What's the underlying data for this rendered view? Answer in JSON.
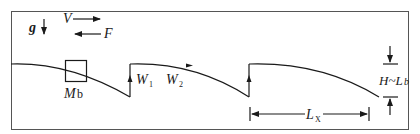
{
  "diagram": {
    "type": "schematic",
    "colors": {
      "line": "#1a1a1a",
      "frame": "#555555",
      "background": "#ffffff"
    },
    "labels": {
      "gravity": "g",
      "velocity": "V",
      "force": "F",
      "mass": "M",
      "mass_sub": "b",
      "w1": "W",
      "w1_sub": "1",
      "w2": "W",
      "w2_sub": "2",
      "height": "H~L",
      "height_sub": "b",
      "length": "L",
      "length_sub": "X"
    },
    "elements": [
      "gravity-arrow-down",
      "velocity-arrow-right",
      "force-arrow-left",
      "mass-box",
      "sawtooth-wave-3-segments",
      "height-dimension",
      "wavelength-dimension"
    ]
  }
}
